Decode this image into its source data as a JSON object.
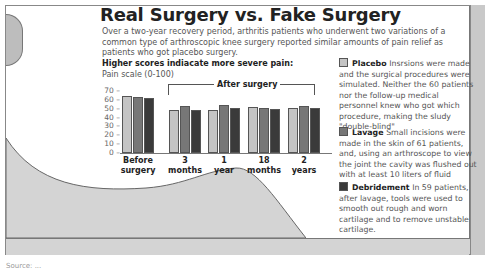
{
  "title": "Real Surgery vs. Fake Surgery",
  "intro": "Over a two-year recovery period, arthritis patients who underwent two variations of a common type of arthroscopic knee surgery reported similar amounts of pain relief as patients who got placebo surgery.",
  "chart_heading": "Higher scores indiacate more severe pain:",
  "chart_subheading": "Pain scale (0-100)",
  "after_surgery_label": "After surgery",
  "colors": {
    "placebo": "#c4c4c4",
    "lavage": "#777777",
    "debridement": "#3a3a3a"
  },
  "legend": [
    {
      "name": "Placebo",
      "text": "Insrsions were made and the surgical procedures were simulated. Neither the 60 patients nor the follow-up medical personnel knew who got which procedure, making the sludy \"double-blind\""
    },
    {
      "name": "Lavage",
      "text": "Small incisions were made in the skin of 61 patients, and, using an arthroscope to view the joint the cavity was flushed out with at least 10 liters of fluid"
    },
    {
      "name": "Debridement",
      "text": "In 59 patients, after lavage, tools were used to smooth out rough and worn cartilage and to remove unstable cartilage."
    }
  ],
  "source": "Source: ...",
  "chart_data": {
    "type": "bar",
    "title": "Real Surgery vs. Fake Surgery",
    "subtitle": "Higher scores indiacate more severe pain: Pain scale (0-100)",
    "xlabel": "",
    "ylabel": "Pain scale (0-100)",
    "ylim": [
      0,
      70
    ],
    "yticks": [
      0,
      10,
      20,
      30,
      40,
      50,
      60,
      70
    ],
    "grid": false,
    "legend_position": "right",
    "categories": [
      "Before surgery",
      "3 months",
      "1 year",
      "18 months",
      "2 years"
    ],
    "category_lines": [
      [
        "Before",
        "surgery"
      ],
      [
        "3",
        "months"
      ],
      [
        "1",
        "year"
      ],
      [
        "18",
        "months"
      ],
      [
        "2",
        "years"
      ]
    ],
    "annotation": "After surgery",
    "series": [
      {
        "name": "Placebo",
        "values": [
          64,
          48,
          48,
          52,
          51
        ]
      },
      {
        "name": "Lavage",
        "values": [
          63,
          53,
          54,
          51,
          53
        ]
      },
      {
        "name": "Debridement",
        "values": [
          62,
          48,
          51,
          50,
          51
        ]
      }
    ]
  }
}
